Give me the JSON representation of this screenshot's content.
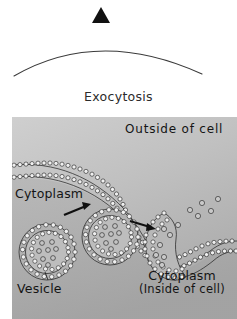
{
  "figure": {
    "caption": "Exocytosis",
    "marker_icon": "solid-triangle-icon",
    "arc_icon": "arc-curve-icon"
  },
  "diagram": {
    "type": "cell-biology-illustration",
    "title": "Exocytosis",
    "labels": {
      "outside": "Outside of cell",
      "cytoplasm_left": "Cytoplasm",
      "vesicle": "Vesicle",
      "cytoplasm_inside_line1": "Cytoplasm",
      "cytoplasm_inside_line2": "(Inside of cell)"
    },
    "colors": {
      "page_background": "#ffffff",
      "panel_background": "#bdbdbd",
      "ink": "#141414",
      "membrane_outline": "#1a1a1a",
      "membrane_bead_fill": "#f2f2f2",
      "caption_text": "#2b2b2b"
    },
    "elements": {
      "vesicle_1_label": "free vesicle in cytoplasm",
      "vesicle_2_label": "vesicle docking at plasma membrane",
      "vesicle_3_label": "fused vesicle releasing contents",
      "arrow_1_label": "movement arrow vesicle 1 to 2",
      "arrow_2_label": "movement arrow vesicle 2 to fusion site",
      "cargo_label": "cargo molecules",
      "membrane_label": "plasma membrane phospholipid bilayer"
    }
  }
}
